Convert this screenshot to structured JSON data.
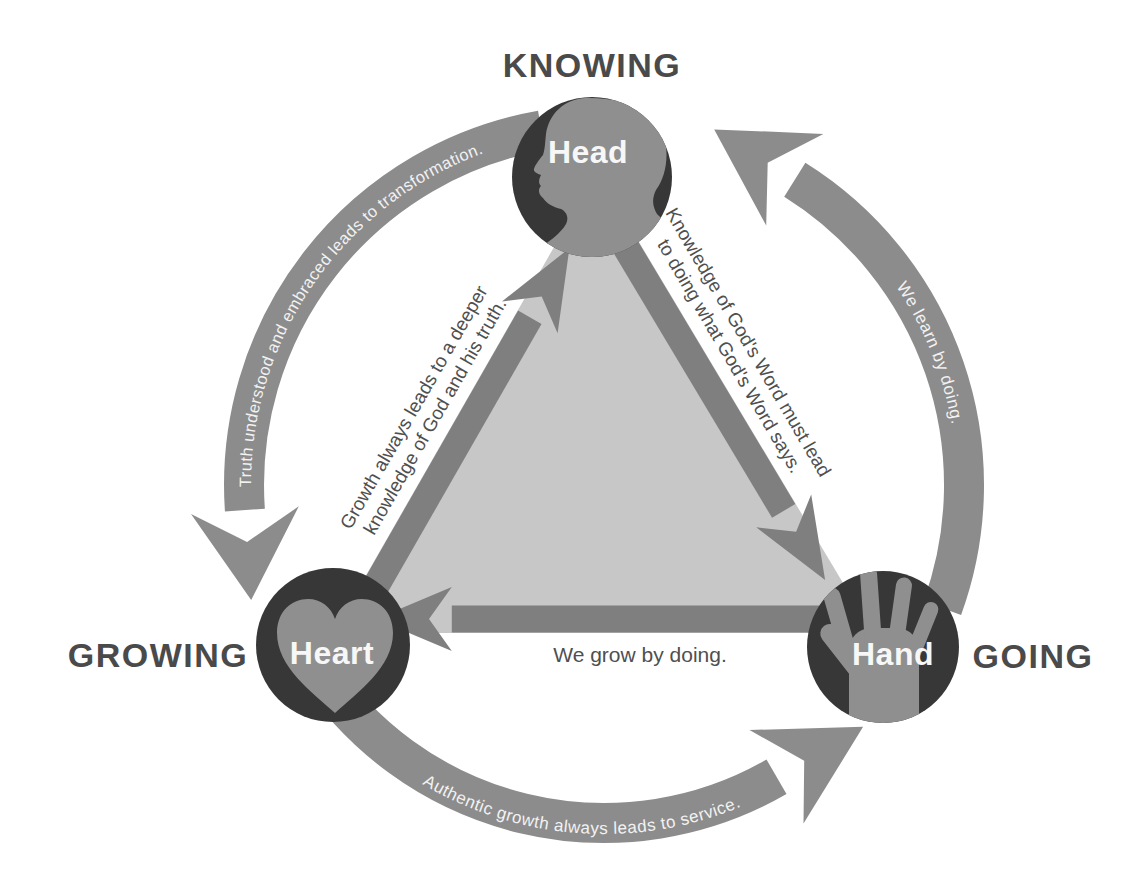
{
  "nodes": {
    "head": {
      "label": "Head",
      "category": "KNOWING",
      "icon": "head-profile-icon"
    },
    "heart": {
      "label": "Heart",
      "category": "GROWING",
      "icon": "heart-icon"
    },
    "hand": {
      "label": "Hand",
      "category": "GOING",
      "icon": "hand-icon"
    }
  },
  "outer_arrows": {
    "head_to_heart": "Truth understood and embraced leads to transformation.",
    "heart_to_hand": "Authentic growth always leads to service.",
    "hand_to_head": "We learn by doing."
  },
  "triangle_arrows": {
    "heart_to_head": {
      "line1": "Growth always leads to a deeper",
      "line2": "knowledge of God and his truth."
    },
    "head_to_hand": {
      "line1": "Knowledge of God's Word must lead",
      "line2": "to doing what God's Word says."
    },
    "hand_to_heart": {
      "label": "We grow by doing."
    }
  },
  "colors": {
    "node_circle": "#373737",
    "silhouette": "#8f8f8f",
    "outer_arrow": "#8c8c8c",
    "triangle_edge": "#7f7f7f",
    "triangle_fill": "#c7c7c7",
    "label_dark": "#4a4a4a",
    "caption_text": "#4f4f4f",
    "arrow_text": "#f2f2f2",
    "node_text": "#f7f7f7",
    "background": "#ffffff"
  }
}
